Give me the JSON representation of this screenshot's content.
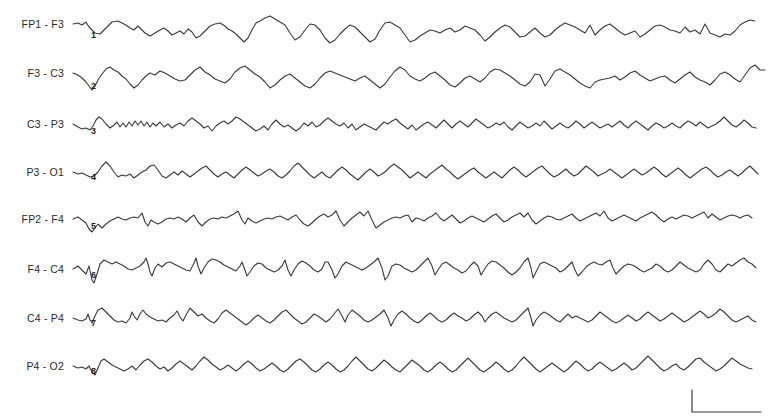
{
  "figure": {
    "type": "EEG bipolar montage recording",
    "channels": [
      {
        "label": "FP1 - F3",
        "marker": "1",
        "y": 24
      },
      {
        "label": "F3 - C3",
        "marker": "2",
        "y": 73
      },
      {
        "label": "C3 - P3",
        "marker": "3",
        "y": 124
      },
      {
        "label": "P3 - O1",
        "marker": "4",
        "y": 172
      },
      {
        "label": "FP2 - F4",
        "marker": "5",
        "y": 219
      },
      {
        "label": "F4 - C4",
        "marker": "6",
        "y": 269
      },
      {
        "label": "C4 - P4",
        "marker": "7",
        "y": 318
      },
      {
        "label": "P4 - O2",
        "marker": "8",
        "y": 366
      }
    ],
    "scale_bar": {
      "x": 692,
      "y_top": 390,
      "y_bottom": 412,
      "x_right": 761,
      "color": "#3a3a3a"
    },
    "trace_color": "#3a3a3a",
    "label_color": "#2a2a2a"
  }
}
